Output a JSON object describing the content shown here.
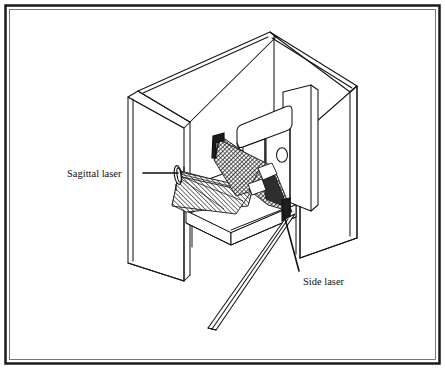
{
  "figure": {
    "kind": "technical-line-drawing",
    "background_color": "#ffffff",
    "line_color": "#111111",
    "hatch_color": "#2a2a2a",
    "width": 445,
    "height": 369
  },
  "border": {
    "outer_color": "#1a1a1a",
    "inner_color": "#555555",
    "outer_width": 2.5,
    "inner_width": 0.8
  },
  "callouts": [
    {
      "id": "sagittal-laser",
      "label": "Sagittal laser",
      "text_x": 67,
      "text_y": 177,
      "leader": {
        "x1": 143,
        "y1": 173,
        "x2": 178,
        "y2": 173
      }
    },
    {
      "id": "side-laser",
      "label": "Side laser",
      "text_x": 303,
      "text_y": 285,
      "leader": {
        "x1": 299,
        "y1": 271,
        "x2": 283,
        "y2": 211
      }
    }
  ],
  "parts": {
    "enclosure": "Three-walled beveled room enclosure",
    "gantry_arm": "Horizontal rounded gantry arm",
    "gantry_column": "Vertical column with circular port",
    "table": "Patient support table",
    "sagittal_emitter": "Sagittal laser emitter on left wall",
    "side_emitter": "Side laser emitter block at right front",
    "sagittal_fan": "Hatched sagittal laser fan plane",
    "side_fan": "Hatched side laser fan plane",
    "floor_beam": "Side laser plane projected across floor"
  }
}
